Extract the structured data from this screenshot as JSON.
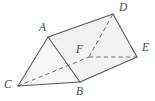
{
  "figure": {
    "type": "triangular-prism",
    "background_color": "#ffffff",
    "edge_color": "#58585a",
    "hidden_edge_color": "#6e6e70",
    "face_fill_color": "#f2f2f2",
    "label_color": "#4a4a4c",
    "width": 155,
    "height": 101,
    "vertices": [
      {
        "id": "A",
        "label": "A",
        "x": 48,
        "y": 37,
        "label_x": 39,
        "label_y": 22,
        "hidden": false
      },
      {
        "id": "B",
        "label": "B",
        "x": 80,
        "y": 82,
        "label_x": 76,
        "label_y": 86,
        "hidden": false
      },
      {
        "id": "C",
        "label": "C",
        "x": 18,
        "y": 86,
        "label_x": 4,
        "label_y": 79,
        "hidden": false
      },
      {
        "id": "D",
        "label": "D",
        "x": 113,
        "y": 14,
        "label_x": 119,
        "label_y": 2,
        "hidden": false
      },
      {
        "id": "E",
        "label": "E",
        "x": 137,
        "y": 57,
        "label_x": 142,
        "label_y": 42,
        "hidden": false
      },
      {
        "id": "F",
        "label": "F",
        "x": 89,
        "y": 57,
        "label_x": 76,
        "label_y": 44,
        "hidden": true
      }
    ],
    "edges": [
      {
        "from": "A",
        "to": "B",
        "style": "solid"
      },
      {
        "from": "A",
        "to": "C",
        "style": "solid"
      },
      {
        "from": "C",
        "to": "B",
        "style": "solid"
      },
      {
        "from": "A",
        "to": "D",
        "style": "solid"
      },
      {
        "from": "B",
        "to": "E",
        "style": "solid"
      },
      {
        "from": "D",
        "to": "E",
        "style": "solid"
      },
      {
        "from": "C",
        "to": "F",
        "style": "dashed"
      },
      {
        "from": "F",
        "to": "E",
        "style": "dashed"
      },
      {
        "from": "F",
        "to": "D",
        "style": "dashed"
      }
    ],
    "faces": [
      {
        "id": "front-triangle-ABC",
        "vertices": [
          "A",
          "B",
          "C"
        ],
        "shade": "light"
      },
      {
        "id": "top-face-ADEB",
        "vertices": [
          "A",
          "D",
          "E",
          "B"
        ],
        "shade": "normal"
      }
    ]
  }
}
